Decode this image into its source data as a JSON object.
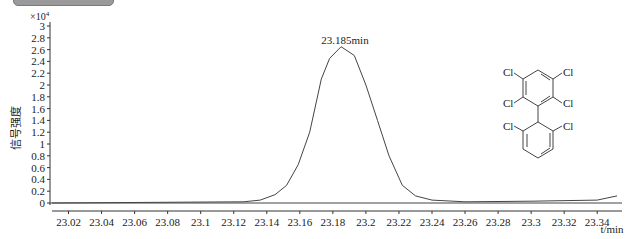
{
  "header": {
    "tab_label": ""
  },
  "chart_data": {
    "type": "line",
    "title": "",
    "xlabel": "t/min",
    "ylabel": "信号强度",
    "y_multiplier": "×10^4",
    "y_multiplier_base": "×10",
    "y_multiplier_exp": "4",
    "xlim": [
      23.01,
      23.355
    ],
    "ylim": [
      0,
      3
    ],
    "x_ticks": [
      "23.02",
      "23.04",
      "23.06",
      "23.08",
      "23.1",
      "23.12",
      "23.14",
      "23.16",
      "23.18",
      "23.2",
      "23.22",
      "23.24",
      "23.26",
      "23.28",
      "23.3",
      "23.32",
      "23.34"
    ],
    "y_ticks": [
      "0",
      "0.2",
      "0.4",
      "0.6",
      "0.8",
      "1",
      "1.2",
      "1.4",
      "1.6",
      "1.8",
      "2",
      "2.2",
      "2.4",
      "2.6",
      "2.8",
      "3"
    ],
    "grid": false,
    "annotation": "23.185min",
    "series": [
      {
        "name": "chromatogram",
        "x": [
          23.01,
          23.126,
          23.136,
          23.145,
          23.152,
          23.159,
          23.166,
          23.173,
          23.178,
          23.185,
          23.193,
          23.2,
          23.207,
          23.214,
          23.222,
          23.23,
          23.24,
          23.26,
          23.3,
          23.34,
          23.352
        ],
        "y": [
          0.0,
          0.02,
          0.05,
          0.14,
          0.3,
          0.65,
          1.2,
          2.1,
          2.45,
          2.65,
          2.5,
          2.0,
          1.4,
          0.8,
          0.3,
          0.12,
          0.05,
          0.02,
          0.03,
          0.05,
          0.12
        ]
      }
    ],
    "structure_labels": [
      "Cl",
      "Cl",
      "Cl",
      "Cl",
      "Cl",
      "Cl"
    ]
  }
}
